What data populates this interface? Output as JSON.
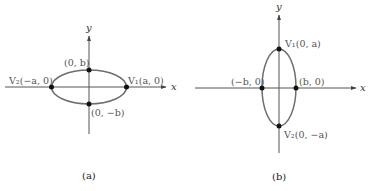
{
  "figures": [
    {
      "id": "a",
      "caption": "(a)",
      "orientation": "horizontal major axis",
      "axes": {
        "x_label": "x",
        "y_label": "y"
      },
      "points": [
        {
          "name": "V2",
          "label": "V₂(−a, 0)"
        },
        {
          "name": "V1",
          "label": "V₁(a, 0)"
        },
        {
          "name": "top",
          "label": "(0, b)"
        },
        {
          "name": "bottom",
          "label": "(0, −b)"
        }
      ]
    },
    {
      "id": "b",
      "caption": "(b)",
      "orientation": "vertical major axis",
      "axes": {
        "x_label": "x",
        "y_label": "y"
      },
      "points": [
        {
          "name": "V1",
          "label": "V₁(0, a)"
        },
        {
          "name": "V2",
          "label": "V₂(0, −a)"
        },
        {
          "name": "left",
          "label": "(−b, 0)"
        },
        {
          "name": "right",
          "label": "(b, 0)"
        }
      ]
    }
  ],
  "colors": {
    "axis": "#555555",
    "ellipse": "#6e6e6e",
    "point": "#111111",
    "label": "#555555"
  }
}
